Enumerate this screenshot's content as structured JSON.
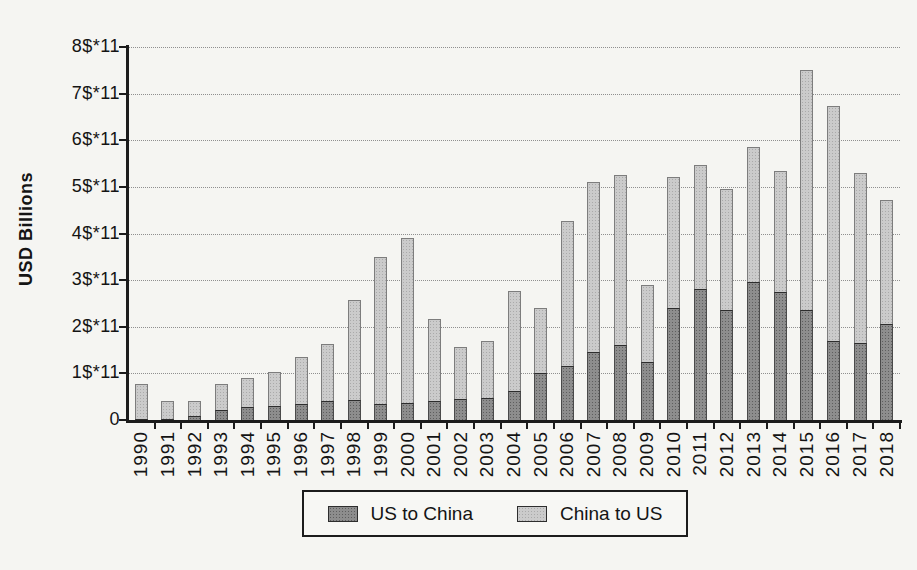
{
  "figure": {
    "background": "#f5f5f2",
    "title": "",
    "y_axis_title": "USD Billions"
  },
  "chart_data": {
    "type": "bar",
    "stacked": true,
    "title": "",
    "xlabel": "",
    "ylabel": "USD Billions",
    "unit_note": "y-axis labeled in units of $*11 (1e11 USD); values below are in those units",
    "ylim": [
      0,
      8
    ],
    "y_tick_labels": [
      "0",
      "1$*11",
      "2$*11",
      "3$*11",
      "4$*11",
      "5$*11",
      "6$*11",
      "7$*11",
      "8$*11"
    ],
    "y_tick_values": [
      0,
      1,
      2,
      3,
      4,
      5,
      6,
      7,
      8
    ],
    "grid": "horizontal dotted gridlines at each y tick",
    "legend_position": "bottom center, boxed",
    "categories": [
      "1990",
      "1991",
      "1992",
      "1993",
      "1994",
      "1995",
      "1996",
      "1997",
      "1998",
      "1999",
      "2000",
      "2001",
      "2002",
      "2003",
      "2004",
      "2005",
      "2006",
      "2007",
      "2008",
      "2009",
      "2010",
      "2011",
      "2012",
      "2013",
      "2014",
      "2015",
      "2016",
      "2017",
      "2018"
    ],
    "series": [
      {
        "name": "US to China",
        "color": "#8d8d8d",
        "dot_color": "#5e5e5e",
        "values": [
          0.02,
          0.02,
          0.09,
          0.22,
          0.28,
          0.3,
          0.35,
          0.4,
          0.42,
          0.35,
          0.36,
          0.4,
          0.46,
          0.47,
          0.63,
          1.0,
          1.15,
          1.45,
          1.6,
          1.25,
          2.4,
          2.8,
          2.35,
          2.95,
          2.75,
          2.35,
          1.7,
          1.65,
          2.05
        ]
      },
      {
        "name": "China to US",
        "color": "#cbcbcb",
        "dot_color": "#aaaaaa",
        "values": [
          0.76,
          0.38,
          0.33,
          0.55,
          0.62,
          0.73,
          1.0,
          1.23,
          2.15,
          3.15,
          3.54,
          1.76,
          1.12,
          1.23,
          2.14,
          1.4,
          3.1,
          3.65,
          3.65,
          1.65,
          2.8,
          2.65,
          2.6,
          2.9,
          2.6,
          5.15,
          5.05,
          3.65,
          2.65
        ]
      }
    ]
  },
  "colors": {
    "axis": "#1c1c1c",
    "gridline": "#8f8f8f",
    "text": "#141414",
    "paper": "#f5f5f2"
  }
}
